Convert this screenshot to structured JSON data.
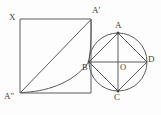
{
  "figure": {
    "background_color": "#fdfdfd",
    "stroke_color": "#5c5c5c",
    "labels": {
      "x": "X",
      "a_prime": "A′",
      "a_double_prime": "A″",
      "a": "A",
      "b": "B",
      "c": "C",
      "d": "D",
      "o": "O"
    },
    "points": {
      "X": {
        "x": 20,
        "y": 19
      },
      "A_prime": {
        "x": 91,
        "y": 19
      },
      "A_double_prime": {
        "x": 20,
        "y": 93
      },
      "square_bottom_right": {
        "x": 91,
        "y": 93
      },
      "A": {
        "x": 118,
        "y": 33
      },
      "B": {
        "x": 89,
        "y": 62
      },
      "C": {
        "x": 118,
        "y": 91
      },
      "D": {
        "x": 147,
        "y": 62
      },
      "O": {
        "x": 118,
        "y": 62
      }
    },
    "circle": {
      "center_x": 118,
      "center_y": 62,
      "radius": 29
    },
    "elements": [
      "square-XA'A''",
      "diagonal-A''-to-A'",
      "arc-A''-to-B",
      "arc-A'-to-B",
      "circle-O",
      "inscribed-square-ABCD",
      "diameter-B-D",
      "diameter-A-C"
    ]
  }
}
